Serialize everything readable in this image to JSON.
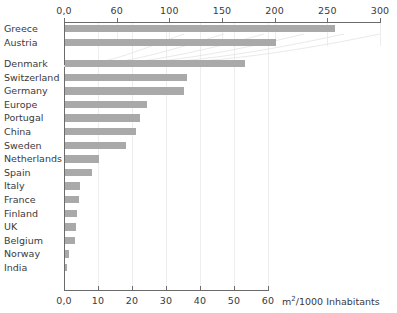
{
  "chart_data": {
    "type": "bar",
    "orientation": "horizontal",
    "title": "",
    "subtitle": "",
    "xlabel": "m²/1000 Inhabitants",
    "ylabel": "",
    "grid": true,
    "legend_position": "none",
    "note": "Dual horizontal scale: Greece and Austria are plotted against the upper axis (0-300); all remaining countries are plotted against the lower axis (0-60).",
    "categories": [
      "Greece",
      "Austria",
      "Denmark",
      "Switzerland",
      "Germany",
      "Europe",
      "Portugal",
      "China",
      "Sweden",
      "Netherlands",
      "Spain",
      "Italy",
      "France",
      "Finland",
      "UK",
      "Belgium",
      "Norway",
      "India"
    ],
    "values": [
      256,
      200,
      53,
      36,
      35,
      24,
      22,
      21,
      18,
      10,
      8,
      4.5,
      4,
      3.5,
      3.2,
      2.9,
      1.3,
      0.7
    ],
    "scales": [
      "top",
      "top",
      "bottom",
      "bottom",
      "bottom",
      "bottom",
      "bottom",
      "bottom",
      "bottom",
      "bottom",
      "bottom",
      "bottom",
      "bottom",
      "bottom",
      "bottom",
      "bottom",
      "bottom",
      "bottom"
    ],
    "top_axis": {
      "label": "",
      "xlim": [
        0,
        300
      ],
      "ticks": [
        0,
        50,
        100,
        150,
        200,
        250,
        300
      ],
      "ticklabels": [
        "0,0",
        "60",
        "100",
        "150",
        "200",
        "250",
        "300"
      ]
    },
    "bottom_axis": {
      "label": "m²/1000 Inhabitants",
      "xlim": [
        0,
        60
      ],
      "ticks": [
        0,
        10,
        20,
        30,
        40,
        50,
        60
      ],
      "ticklabels": [
        "0,0",
        "10",
        "20",
        "30",
        "40",
        "50",
        "60"
      ]
    },
    "colors": {
      "bar": "#a9a9a9",
      "axis": "#6b6b6b",
      "grid": "#ededed",
      "text": "#3a3a3a",
      "background": "#ffffff"
    }
  },
  "top_axis_ticklabels": {
    "0": "0,0",
    "1": "60",
    "2": "100",
    "3": "150",
    "4": "200",
    "5": "250",
    "6": "300"
  },
  "bottom_axis_ticklabels": {
    "0": "0,0",
    "1": "10",
    "2": "20",
    "3": "30",
    "4": "40",
    "5": "50",
    "6": "60"
  },
  "category_labels": {
    "0": "Greece",
    "1": "Austria",
    "2": "Denmark",
    "3": "Switzerland",
    "4": "Germany",
    "5": "Europe",
    "6": "Portugal",
    "7": "China",
    "8": "Sweden",
    "9": "Netherlands",
    "10": "Spain",
    "11": "Italy",
    "12": "France",
    "13": "Finland",
    "14": "UK",
    "15": "Belgium",
    "16": "Norway",
    "17": "India"
  },
  "axis_title": "m²/1000 Inhabitants"
}
